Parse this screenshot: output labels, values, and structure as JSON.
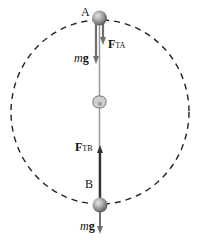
{
  "diagram": {
    "point_a": {
      "label": "A"
    },
    "point_b": {
      "label": "B"
    },
    "force_ta": {
      "symbol": "F",
      "subscript": "TA"
    },
    "force_tb": {
      "symbol": "F",
      "subscript": "TB"
    },
    "weight_a": {
      "m": "m",
      "g": "g"
    },
    "weight_b": {
      "m": "m",
      "g": "g"
    },
    "colors": {
      "path": "#222222",
      "string": "#9a9a9a",
      "arrow": "#707070",
      "ball": "#8a8a8a"
    }
  }
}
